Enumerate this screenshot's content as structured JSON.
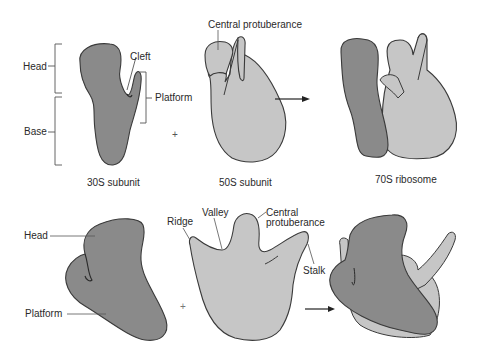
{
  "colors": {
    "small_subunit_fill": "#8a8a8a",
    "large_subunit_fill": "#c6c6c6",
    "outline": "#3a3a3a",
    "leader_line": "#555555",
    "background": "#ffffff"
  },
  "top_row": {
    "small_subunit": {
      "caption": "30S subunit",
      "labels": {
        "head": "Head",
        "base": "Base",
        "cleft": "Cleft",
        "platform": "Platform"
      }
    },
    "operator_plus": "+",
    "large_subunit": {
      "caption": "50S subunit",
      "labels": {
        "central_protuberance": "Central protuberance"
      }
    },
    "operator_arrow": "→",
    "assembled": {
      "caption": "70S ribosome"
    }
  },
  "bottom_row": {
    "small_subunit": {
      "labels": {
        "head": "Head",
        "platform": "Platform"
      }
    },
    "operator_plus": "+",
    "large_subunit": {
      "labels": {
        "ridge": "Ridge",
        "valley": "Valley",
        "central_protuberance_1": "Central",
        "central_protuberance_2": "protuberance",
        "stalk": "Stalk"
      }
    },
    "operator_arrow": "→"
  }
}
